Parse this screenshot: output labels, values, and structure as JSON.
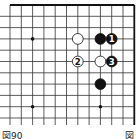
{
  "diagram": {
    "type": "go-board-corner",
    "caption": "図90",
    "caption_right": "図",
    "visible_columns": 12,
    "visible_rows": 11,
    "edges": [
      "top",
      "right"
    ],
    "star_points": [
      {
        "col": 2,
        "row": 3
      },
      {
        "col": 2,
        "row": 9
      },
      {
        "col": 8,
        "row": 9
      }
    ],
    "stones": [
      {
        "color": "white",
        "col": 6,
        "row": 3,
        "label": ""
      },
      {
        "color": "black",
        "col": 8,
        "row": 3,
        "label": ""
      },
      {
        "color": "black",
        "col": 9,
        "row": 3,
        "label": "1"
      },
      {
        "color": "white",
        "col": 6,
        "row": 5,
        "label": "2"
      },
      {
        "color": "white",
        "col": 8,
        "row": 5,
        "label": ""
      },
      {
        "color": "black",
        "col": 9,
        "row": 5,
        "label": "3"
      },
      {
        "color": "black",
        "col": 8,
        "row": 7,
        "label": ""
      }
    ],
    "colors": {
      "line": "#333333",
      "edge": "#111111",
      "black_stone": "#111111",
      "white_stone": "#ffffff",
      "star": "#111111"
    }
  }
}
